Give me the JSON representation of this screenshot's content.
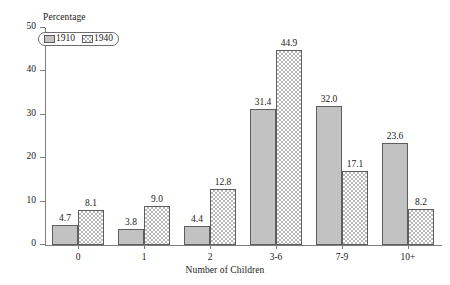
{
  "chart_data": {
    "type": "bar",
    "title": "",
    "xlabel": "Number of Children",
    "ylabel": "Percentage",
    "categories": [
      "0",
      "1",
      "2",
      "3-6",
      "7-9",
      "10+"
    ],
    "series": [
      {
        "name": "1910",
        "values": [
          4.7,
          3.8,
          4.4,
          31.4,
          32.0,
          23.6
        ],
        "pattern": "solid-gray",
        "color": "#c2c2c2"
      },
      {
        "name": "1940",
        "values": [
          8.1,
          9.0,
          12.8,
          44.9,
          17.1,
          8.2
        ],
        "pattern": "checkerboard",
        "color": "#b9b9b9"
      }
    ],
    "value_labels": [
      [
        "4.7",
        "3.8",
        "4.4",
        "31.4",
        "32.0",
        "23.6"
      ],
      [
        "8.1",
        "9.0",
        "12.8",
        "44.9",
        "17.1",
        "8.2"
      ]
    ],
    "ylim": [
      0,
      50
    ],
    "yticks": [
      0,
      10,
      20,
      30,
      40,
      50
    ],
    "ytick_labels": [
      "0",
      "10",
      "20",
      "30",
      "40",
      "50"
    ],
    "grid": false,
    "legend_position": "top-left",
    "axis_color": "#7d7d7d",
    "bar_outline_color": "#5e5e5e"
  },
  "legend": {
    "items": [
      {
        "label": "1910"
      },
      {
        "label": "1940"
      }
    ]
  }
}
